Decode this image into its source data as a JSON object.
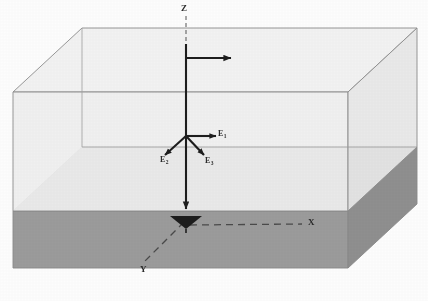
{
  "figure": {
    "watermark_text": "Image segment"
  },
  "axes": [
    {
      "id": "z",
      "label": "Z",
      "description": "vertical axis pointing down into sediment"
    },
    {
      "id": "x",
      "label": "X",
      "description": "horizontal dashed axis to the right"
    },
    {
      "id": "y",
      "label": "Y",
      "description": "dashed axis toward lower-left (depth)"
    }
  ],
  "vectors": [
    {
      "id": "e1",
      "label": "E",
      "subscript": "1",
      "direction": "right"
    },
    {
      "id": "e2",
      "label": "E",
      "subscript": "2",
      "direction": "down-left"
    },
    {
      "id": "e3",
      "label": "E",
      "subscript": "3",
      "direction": "down-right"
    }
  ],
  "top_arrow": {
    "id": "flow-arrow",
    "label": "",
    "direction": "right"
  },
  "colors": {
    "water_front": "#efefef",
    "water_right": "#e6e6e6",
    "sediment_top": "#a8a8a8",
    "sediment_front": "#9a9a9a",
    "sediment_right": "#8e8e8e",
    "outline": "#8c8c8c",
    "ink": "#2b2b2b",
    "background": "#fdfdfd"
  }
}
